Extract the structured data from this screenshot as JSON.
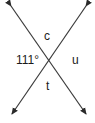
{
  "diagram": {
    "type": "intersecting-lines",
    "colors": {
      "line": "#3a3a3a",
      "text": "#1a1a1a",
      "background": "#ffffff"
    },
    "lines": [
      {
        "name": "line-1",
        "from": [
          9,
          3
        ],
        "to": [
          88,
          117
        ],
        "arrowheads": "both"
      },
      {
        "name": "line-2",
        "from": [
          88,
          3
        ],
        "to": [
          10,
          117
        ],
        "arrowheads": "both"
      }
    ],
    "intersection": [
      49,
      60
    ],
    "labels": {
      "top": "c",
      "left": "111°",
      "right": "u",
      "bottom": "t"
    }
  }
}
